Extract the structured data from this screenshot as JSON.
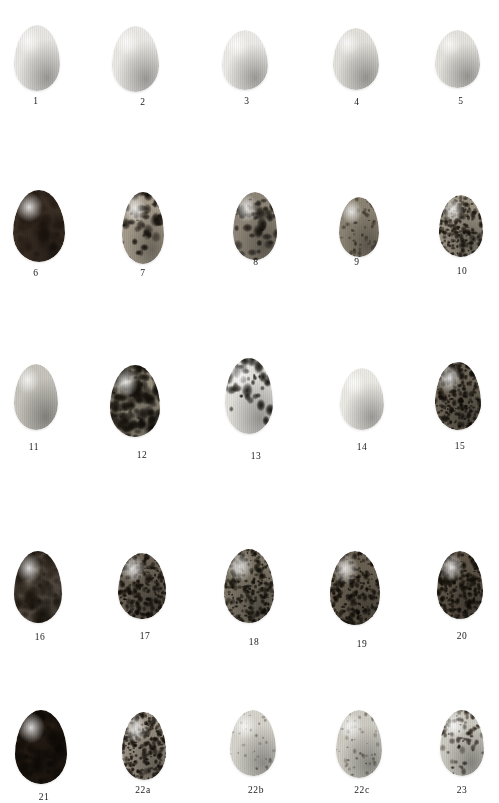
{
  "plate": {
    "background": "#ffffff",
    "caption_color": "#1a1a1a",
    "rows": 5,
    "columns": 5,
    "total_specimens": 24
  },
  "eggs": [
    {
      "label": "1",
      "x": 14,
      "y": 25,
      "w": 46,
      "h": 66,
      "base": "#e9e8e4",
      "pattern": "plain",
      "density": 0,
      "spot": "#6d6252",
      "caption_x": 36,
      "caption_y": 96
    },
    {
      "label": "2",
      "x": 112,
      "y": 26,
      "w": 47,
      "h": 66,
      "base": "#eceae6",
      "pattern": "plain",
      "density": 0,
      "spot": "#6d6252",
      "caption_x": 143,
      "caption_y": 97
    },
    {
      "label": "3",
      "x": 222,
      "y": 30,
      "w": 46,
      "h": 60,
      "base": "#eeece8",
      "pattern": "plain",
      "density": 0,
      "spot": "#6d6252",
      "caption_x": 247,
      "caption_y": 96
    },
    {
      "label": "4",
      "x": 333,
      "y": 28,
      "w": 46,
      "h": 62,
      "base": "#e4e2dc",
      "pattern": "plain",
      "density": 0,
      "spot": "#6d6252",
      "caption_x": 357,
      "caption_y": 97
    },
    {
      "label": "5",
      "x": 435,
      "y": 30,
      "w": 45,
      "h": 58,
      "base": "#e6e4de",
      "pattern": "plain",
      "density": 0,
      "spot": "#6d6252",
      "caption_x": 461,
      "caption_y": 96
    },
    {
      "label": "6",
      "x": 13,
      "y": 190,
      "w": 52,
      "h": 72,
      "base": "#3b2f25",
      "pattern": "mottled",
      "density": 0.35,
      "spot": "#1b120c",
      "caption_x": 36,
      "caption_y": 268
    },
    {
      "label": "7",
      "x": 122,
      "y": 192,
      "w": 42,
      "h": 72,
      "base": "#a59c8c",
      "pattern": "blotch-top",
      "density": 0.55,
      "spot": "#15100a",
      "caption_x": 143,
      "caption_y": 268
    },
    {
      "label": "8",
      "x": 233,
      "y": 192,
      "w": 44,
      "h": 68,
      "base": "#8e8678",
      "pattern": "blotch-top",
      "density": 0.6,
      "spot": "#14100b",
      "caption_x": 256,
      "caption_y": 257
    },
    {
      "label": "9",
      "x": 339,
      "y": 197,
      "w": 40,
      "h": 60,
      "base": "#8c8474",
      "pattern": "speckled",
      "density": 0.45,
      "spot": "#2a2118",
      "caption_x": 357,
      "caption_y": 257
    },
    {
      "label": "10",
      "x": 439,
      "y": 195,
      "w": 44,
      "h": 62,
      "base": "#9b9384",
      "pattern": "speckled-heavy",
      "density": 0.8,
      "spot": "#1d170f",
      "caption_x": 462,
      "caption_y": 266
    },
    {
      "label": "11",
      "x": 14,
      "y": 364,
      "w": 44,
      "h": 66,
      "base": "#c7c5bd",
      "pattern": "plain",
      "density": 0,
      "spot": "#6d6252",
      "caption_x": 34,
      "caption_y": 442
    },
    {
      "label": "12",
      "x": 110,
      "y": 365,
      "w": 50,
      "h": 72,
      "base": "#9b9383",
      "pattern": "blotch-heavy",
      "density": 0.85,
      "spot": "#14100a",
      "caption_x": 142,
      "caption_y": 450
    },
    {
      "label": "13",
      "x": 225,
      "y": 358,
      "w": 48,
      "h": 76,
      "base": "#e3e2dd",
      "pattern": "scrawl-top",
      "density": 0.7,
      "spot": "#100c07",
      "caption_x": 256,
      "caption_y": 451
    },
    {
      "label": "14",
      "x": 340,
      "y": 368,
      "w": 44,
      "h": 62,
      "base": "#ecebe5",
      "pattern": "plain",
      "density": 0,
      "spot": "#6d6252",
      "caption_x": 362,
      "caption_y": 442
    },
    {
      "label": "15",
      "x": 435,
      "y": 362,
      "w": 46,
      "h": 68,
      "base": "#6e6658",
      "pattern": "speckled-heavy",
      "density": 0.9,
      "spot": "#120e09",
      "caption_x": 460,
      "caption_y": 441
    },
    {
      "label": "16",
      "x": 14,
      "y": 551,
      "w": 48,
      "h": 72,
      "base": "#5c5348",
      "pattern": "mottled",
      "density": 0.75,
      "spot": "#171009",
      "caption_x": 40,
      "caption_y": 632
    },
    {
      "label": "17",
      "x": 118,
      "y": 553,
      "w": 48,
      "h": 66,
      "base": "#6b6356",
      "pattern": "speckled-heavy",
      "density": 0.9,
      "spot": "#120d08",
      "caption_x": 145,
      "caption_y": 631
    },
    {
      "label": "18",
      "x": 224,
      "y": 549,
      "w": 50,
      "h": 74,
      "base": "#7d7567",
      "pattern": "speckled-heavy",
      "density": 0.92,
      "spot": "#131008",
      "caption_x": 254,
      "caption_y": 637
    },
    {
      "label": "19",
      "x": 330,
      "y": 551,
      "w": 50,
      "h": 74,
      "base": "#6a6153",
      "pattern": "speckled-heavy",
      "density": 0.92,
      "spot": "#110d07",
      "caption_x": 362,
      "caption_y": 639
    },
    {
      "label": "20",
      "x": 437,
      "y": 551,
      "w": 46,
      "h": 68,
      "base": "#5f5649",
      "pattern": "speckled-heavy",
      "density": 0.9,
      "spot": "#110d07",
      "caption_x": 462,
      "caption_y": 631
    },
    {
      "label": "21",
      "x": 15,
      "y": 710,
      "w": 52,
      "h": 74,
      "base": "#241b13",
      "pattern": "mottled",
      "density": 0.55,
      "spot": "#090603",
      "caption_x": 44,
      "caption_y": 792
    },
    {
      "label": "22a",
      "x": 122,
      "y": 712,
      "w": 44,
      "h": 68,
      "base": "#9a9183",
      "pattern": "speckled-heavy",
      "density": 0.88,
      "spot": "#15100a",
      "caption_x": 143,
      "caption_y": 785
    },
    {
      "label": "22b",
      "x": 230,
      "y": 710,
      "w": 46,
      "h": 66,
      "base": "#d7d5cd",
      "pattern": "speckled-light",
      "density": 0.3,
      "spot": "#4a4034",
      "caption_x": 256,
      "caption_y": 785
    },
    {
      "label": "22c",
      "x": 336,
      "y": 710,
      "w": 46,
      "h": 68,
      "base": "#cfcdc4",
      "pattern": "speckled-light",
      "density": 0.42,
      "spot": "#3b3228",
      "caption_x": 362,
      "caption_y": 785
    },
    {
      "label": "23",
      "x": 440,
      "y": 710,
      "w": 44,
      "h": 66,
      "base": "#cdcbc2",
      "pattern": "speckled-top",
      "density": 0.55,
      "spot": "#241c13",
      "caption_x": 462,
      "caption_y": 785
    }
  ]
}
